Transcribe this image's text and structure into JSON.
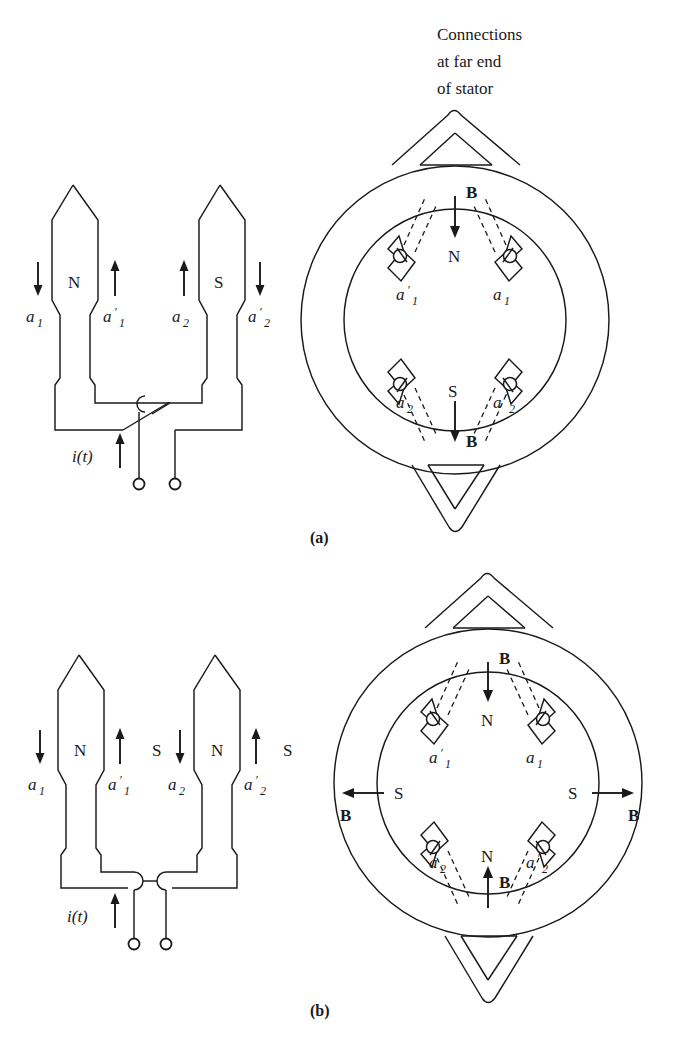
{
  "figure": {
    "title_note": [
      "Connections",
      "at far end",
      "of stator"
    ],
    "captions": {
      "a": "(a)",
      "b": "(b)"
    }
  },
  "panel_a": {
    "caption": "(a)",
    "coil_diagram": {
      "name": "two-coil-series-winding-crossed",
      "side_labels": [
        "a",
        "a",
        "a",
        "a"
      ],
      "side_names": [
        "a1",
        "a'1",
        "a2",
        "a'2"
      ],
      "labels": [
        {
          "base": "a",
          "prime": "",
          "sub": "1",
          "arrow": "down"
        },
        {
          "base": "a",
          "prime": "′",
          "sub": "1",
          "arrow": "up"
        },
        {
          "base": "a",
          "prime": "",
          "sub": "2",
          "arrow": "up"
        },
        {
          "base": "a",
          "prime": "′",
          "sub": "2",
          "arrow": "down"
        }
      ],
      "pole_labels": [
        "N",
        "S"
      ],
      "current_label": "i(t)",
      "current_arrow": "up"
    },
    "stator_diagram": {
      "slot_labels": [
        {
          "base": "a",
          "prime": "′",
          "sub": "1",
          "position": "top-left"
        },
        {
          "base": "a",
          "prime": "",
          "sub": "1",
          "position": "top-right"
        },
        {
          "base": "a",
          "prime": "",
          "sub": "2",
          "position": "bottom-left"
        },
        {
          "base": "a",
          "prime": "′",
          "sub": "2",
          "position": "bottom-right"
        }
      ],
      "field_arrows": [
        {
          "label": "B",
          "pole": "N",
          "direction": "down",
          "position": "top"
        },
        {
          "label": "B",
          "pole": "S",
          "direction": "down",
          "position": "bottom"
        }
      ],
      "end_connection_shape": "triangular-overhang"
    }
  },
  "panel_b": {
    "caption": "(b)",
    "coil_diagram": {
      "name": "two-coil-series-winding-uncrossed",
      "labels": [
        {
          "base": "a",
          "prime": "",
          "sub": "1",
          "arrow": "down"
        },
        {
          "base": "a",
          "prime": "′",
          "sub": "1",
          "arrow": "up"
        },
        {
          "base": "a",
          "prime": "",
          "sub": "2",
          "arrow": "down"
        },
        {
          "base": "a",
          "prime": "′",
          "sub": "2",
          "arrow": "up"
        }
      ],
      "pole_labels": [
        "N",
        "S",
        "N",
        "S"
      ],
      "current_label": "i(t)",
      "current_arrow": "up"
    },
    "stator_diagram": {
      "slot_labels": [
        {
          "base": "a",
          "prime": "′",
          "sub": "1",
          "position": "top-left"
        },
        {
          "base": "a",
          "prime": "",
          "sub": "1",
          "position": "top-right"
        },
        {
          "base": "a",
          "prime": "",
          "sub": "2",
          "position": "bottom-left"
        },
        {
          "base": "a",
          "prime": "′",
          "sub": "2",
          "position": "bottom-right"
        }
      ],
      "field_arrows": [
        {
          "label": "B",
          "pole": "N",
          "direction": "down",
          "position": "top"
        },
        {
          "label": "B",
          "pole": "N",
          "direction": "up",
          "position": "bottom"
        },
        {
          "label": "B",
          "pole": "S",
          "direction": "left",
          "position": "left"
        },
        {
          "label": "B",
          "pole": "S",
          "direction": "right",
          "position": "right"
        }
      ],
      "end_connection_shape": "triangular-overhang"
    }
  },
  "colors": {
    "ink": "#1a1a1a",
    "paper": "#ffffff"
  }
}
